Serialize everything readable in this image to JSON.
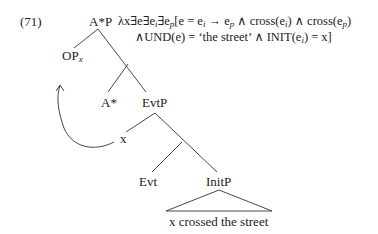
{
  "example_number": "(71)",
  "nodes": {
    "root": "A*P",
    "op": "OP",
    "op_sub": "x",
    "a_star": "A*",
    "evtp": "EvtP",
    "x_trace": "x",
    "evt": "Evt",
    "initp": "InitP",
    "initp_content": "x crossed the street"
  },
  "formula": {
    "line1": {
      "lambda": "λx∃e∃e",
      "sub_i": "i",
      "exists_p": "∃e",
      "sub_p": "p",
      "open": "[e = e",
      "arrow": " → e",
      "cross1": " ∧ cross(e",
      "cross1_close": ") ∧ cross(e",
      "close": ")"
    },
    "line2": {
      "und": "∧UND(e) = ‘the street’ ∧ INIT(e",
      "end": ") = x]"
    }
  },
  "colors": {
    "text": "#222222",
    "lines": "#333333"
  }
}
